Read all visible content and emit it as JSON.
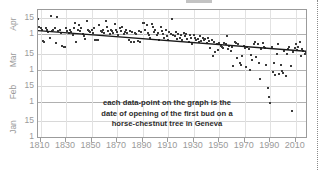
{
  "chart_data": {
    "type": "scatter",
    "title": "",
    "annotation": [
      "each data-point on the graph is the",
      "date of opening of the first bud on a",
      "horse-chestnut tree in Geneva"
    ],
    "xlabel": "",
    "ylabel": "",
    "xlim": [
      1808,
      2018
    ],
    "x_ticks": [
      1810,
      1830,
      1850,
      1870,
      1890,
      1910,
      1930,
      1950,
      1970,
      1990,
      2010
    ],
    "x_tick_labels": [
      "1810",
      "1830",
      "1850",
      "1870",
      "1890",
      "1910",
      "1930",
      "1950",
      "1970",
      "1990",
      "2010"
    ],
    "y_axis_description": "Date of first bud opening (day of year, Jan 1 at bottom to Apr 15 at top)",
    "y_tick_labels": [
      "15",
      "1",
      "15",
      "1",
      "15",
      "1",
      "15",
      "1"
    ],
    "y_tick_day_of_year": [
      105,
      91,
      74,
      60,
      46,
      32,
      15,
      1
    ],
    "y_month_labels": [
      "Apr",
      "Mar",
      "Feb",
      "Jan"
    ],
    "ylim": [
      1,
      112
    ],
    "grid": true,
    "legend": null,
    "colors": {
      "point": "#3a3a3a",
      "trend_line": "#1a1a1a",
      "axis_text": "#9a9a9a",
      "annotation_text": "#2b2b2b",
      "grid_minor": "#e2e2e2",
      "grid_major": "#b0b0b0",
      "frame": "#9b9b9b",
      "background": "#ffffff"
    },
    "trend_line": {
      "type": "linear",
      "x_start": 1808,
      "y_start": 94,
      "x_end": 2018,
      "y_end": 76
    },
    "series": [
      {
        "name": "first bud opening date",
        "marker": "square",
        "points": [
          [
            1808,
            104
          ],
          [
            1809,
            97
          ],
          [
            1810,
            96
          ],
          [
            1811,
            95
          ],
          [
            1812,
            85
          ],
          [
            1813,
            84
          ],
          [
            1814,
            96
          ],
          [
            1815,
            95
          ],
          [
            1816,
            93
          ],
          [
            1817,
            88
          ],
          [
            1818,
            107
          ],
          [
            1819,
            94
          ],
          [
            1820,
            95
          ],
          [
            1821,
            96
          ],
          [
            1822,
            83
          ],
          [
            1823,
            106
          ],
          [
            1824,
            94
          ],
          [
            1825,
            95
          ],
          [
            1826,
            92
          ],
          [
            1827,
            81
          ],
          [
            1828,
            80
          ],
          [
            1829,
            80
          ],
          [
            1830,
            96
          ],
          [
            1831,
            94
          ],
          [
            1832,
            92
          ],
          [
            1833,
            95
          ],
          [
            1834,
            93
          ],
          [
            1835,
            90
          ],
          [
            1836,
            96
          ],
          [
            1837,
            101
          ],
          [
            1838,
            84
          ],
          [
            1839,
            95
          ],
          [
            1840,
            99
          ],
          [
            1841,
            94
          ],
          [
            1842,
            96
          ],
          [
            1843,
            91
          ],
          [
            1844,
            89
          ],
          [
            1845,
            87
          ],
          [
            1846,
            102
          ],
          [
            1847,
            95
          ],
          [
            1848,
            94
          ],
          [
            1849,
            93
          ],
          [
            1850,
            95
          ],
          [
            1851,
            92
          ],
          [
            1852,
            96
          ],
          [
            1853,
            86
          ],
          [
            1854,
            86
          ],
          [
            1855,
            86
          ],
          [
            1856,
            99
          ],
          [
            1857,
            94
          ],
          [
            1858,
            93
          ],
          [
            1859,
            95
          ],
          [
            1860,
            92
          ],
          [
            1861,
            102
          ],
          [
            1862,
            97
          ],
          [
            1863,
            94
          ],
          [
            1864,
            91
          ],
          [
            1865,
            95
          ],
          [
            1866,
            94
          ],
          [
            1867,
            92
          ],
          [
            1868,
            100
          ],
          [
            1869,
            95
          ],
          [
            1870,
            93
          ],
          [
            1871,
            90
          ],
          [
            1872,
            96
          ],
          [
            1873,
            94
          ],
          [
            1874,
            97
          ],
          [
            1875,
            91
          ],
          [
            1876,
            93
          ],
          [
            1877,
            95
          ],
          [
            1878,
            92
          ],
          [
            1879,
            86
          ],
          [
            1880,
            94
          ],
          [
            1881,
            84
          ],
          [
            1882,
            93
          ],
          [
            1883,
            84
          ],
          [
            1884,
            92
          ],
          [
            1885,
            91
          ],
          [
            1886,
            85
          ],
          [
            1887,
            94
          ],
          [
            1888,
            84
          ],
          [
            1889,
            93
          ],
          [
            1890,
            101
          ],
          [
            1891,
            101
          ],
          [
            1892,
            95
          ],
          [
            1893,
            99
          ],
          [
            1894,
            92
          ],
          [
            1895,
            90
          ],
          [
            1896,
            88
          ],
          [
            1897,
            100
          ],
          [
            1898,
            97
          ],
          [
            1899,
            93
          ],
          [
            1900,
            95
          ],
          [
            1901,
            90
          ],
          [
            1902,
            92
          ],
          [
            1903,
            86
          ],
          [
            1904,
            97
          ],
          [
            1905,
            94
          ],
          [
            1906,
            91
          ],
          [
            1907,
            88
          ],
          [
            1908,
            95
          ],
          [
            1909,
            89
          ],
          [
            1910,
            86
          ],
          [
            1911,
            93
          ],
          [
            1912,
            91
          ],
          [
            1913,
            104
          ],
          [
            1914,
            90
          ],
          [
            1915,
            89
          ],
          [
            1916,
            93
          ],
          [
            1917,
            87
          ],
          [
            1918,
            91
          ],
          [
            1919,
            88
          ],
          [
            1920,
            90
          ],
          [
            1921,
            86
          ],
          [
            1922,
            92
          ],
          [
            1923,
            89
          ],
          [
            1924,
            91
          ],
          [
            1925,
            87
          ],
          [
            1926,
            84
          ],
          [
            1927,
            90
          ],
          [
            1928,
            88
          ],
          [
            1929,
            82
          ],
          [
            1930,
            90
          ],
          [
            1931,
            88
          ],
          [
            1932,
            86
          ],
          [
            1933,
            87
          ],
          [
            1934,
            84
          ],
          [
            1935,
            89
          ],
          [
            1936,
            85
          ],
          [
            1937,
            88
          ],
          [
            1938,
            86
          ],
          [
            1939,
            87
          ],
          [
            1940,
            83
          ],
          [
            1941,
            88
          ],
          [
            1942,
            85
          ],
          [
            1943,
            79
          ],
          [
            1944,
            86
          ],
          [
            1945,
            72
          ],
          [
            1946,
            84
          ],
          [
            1947,
            75
          ],
          [
            1948,
            82
          ],
          [
            1949,
            77
          ],
          [
            1950,
            83
          ],
          [
            1951,
            81
          ],
          [
            1952,
            80
          ],
          [
            1953,
            79
          ],
          [
            1954,
            83
          ],
          [
            1955,
            82
          ],
          [
            1956,
            89
          ],
          [
            1957,
            78
          ],
          [
            1958,
            81
          ],
          [
            1959,
            76
          ],
          [
            1960,
            80
          ],
          [
            1961,
            63
          ],
          [
            1962,
            84
          ],
          [
            1963,
            83
          ],
          [
            1964,
            70
          ],
          [
            1965,
            82
          ],
          [
            1966,
            66
          ],
          [
            1967,
            64
          ],
          [
            1968,
            72
          ],
          [
            1969,
            81
          ],
          [
            1970,
            79
          ],
          [
            1971,
            62
          ],
          [
            1972,
            80
          ],
          [
            1973,
            78
          ],
          [
            1974,
            60
          ],
          [
            1975,
            73
          ],
          [
            1976,
            68
          ],
          [
            1977,
            82
          ],
          [
            1978,
            84
          ],
          [
            1979,
            71
          ],
          [
            1980,
            82
          ],
          [
            1981,
            66
          ],
          [
            1982,
            52
          ],
          [
            1983,
            78
          ],
          [
            1984,
            83
          ],
          [
            1985,
            80
          ],
          [
            1986,
            79
          ],
          [
            1987,
            64
          ],
          [
            1988,
            44
          ],
          [
            1989,
            36
          ],
          [
            1990,
            31
          ],
          [
            1991,
            80
          ],
          [
            1992,
            58
          ],
          [
            1993,
            66
          ],
          [
            1994,
            55
          ],
          [
            1995,
            74
          ],
          [
            1996,
            82
          ],
          [
            1997,
            56
          ],
          [
            1998,
            64
          ],
          [
            1999,
            59
          ],
          [
            2000,
            57
          ],
          [
            2001,
            76
          ],
          [
            2002,
            54
          ],
          [
            2003,
            74
          ],
          [
            2004,
            78
          ],
          [
            2005,
            80
          ],
          [
            2006,
            63
          ],
          [
            2007,
            24
          ],
          [
            2008,
            75
          ],
          [
            2009,
            79
          ],
          [
            2010,
            82
          ],
          [
            2011,
            77
          ],
          [
            2012,
            80
          ],
          [
            2013,
            84
          ],
          [
            2014,
            72
          ],
          [
            2015,
            78
          ],
          [
            2016,
            76
          ],
          [
            2017,
            74
          ],
          [
            2018,
            75
          ]
        ]
      }
    ]
  }
}
